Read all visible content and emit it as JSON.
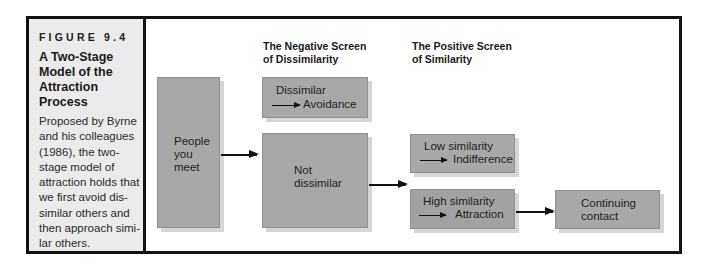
{
  "figure": {
    "label": "FIGURE 9.4",
    "title": "A Two-Stage Model of the Attraction Process",
    "caption": "Proposed by Byrne and his colleagues (1986), the two-stage model of attraction holds that we first avoid dissimilar others and then approach similar others.",
    "caption_lines": [
      "Proposed by Byrne",
      "and his colleagues",
      "(1986), the two-",
      "stage model of",
      "attraction holds that",
      "we first avoid dis-",
      "similar others and",
      "then approach simi-",
      "lar others."
    ],
    "title_lines": [
      "A Two-Stage",
      "Model of the",
      "Attraction",
      "Process"
    ]
  },
  "diagram": {
    "headings": {
      "negative": [
        "The Negative Screen",
        "of Dissimilarity"
      ],
      "positive": [
        "The Positive Screen",
        "of Similarity"
      ]
    },
    "boxes": {
      "people": [
        "People",
        "you",
        "meet"
      ],
      "dissimilar": {
        "cond": "Dissimilar",
        "result": "Avoidance"
      },
      "not_dissimilar": [
        "Not",
        "dissimilar"
      ],
      "low_similarity": {
        "cond": "Low similarity",
        "result": "Indifference"
      },
      "high_similarity": {
        "cond": "High similarity",
        "result": "Attraction"
      },
      "continuing": [
        "Continuing",
        "contact"
      ]
    },
    "colors": {
      "box_fill": "#a8a8a8",
      "box_shadow": "#d6d6d6",
      "sidebar_bg": "#ebebeb",
      "border": "#111111"
    }
  }
}
